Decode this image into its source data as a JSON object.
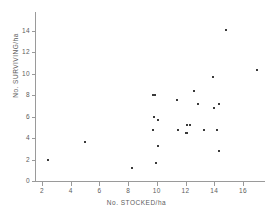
{
  "chart_data": {
    "type": "scatter",
    "title": "",
    "xlabel": "No. STOCKED/ha",
    "ylabel": "No. SURVIVING/ha",
    "xlim": [
      1.2,
      17.8
    ],
    "ylim": [
      0,
      15.0
    ],
    "xticks": [
      2,
      4,
      6,
      8,
      10,
      12,
      14,
      16
    ],
    "yticks": [
      0,
      2,
      4,
      6,
      8,
      10,
      12,
      14
    ],
    "xticklabels": [
      "2",
      "4",
      "6",
      "8",
      "10",
      "12",
      "14",
      "16"
    ],
    "yticklabels": [
      "0",
      "2",
      "4",
      "6",
      "8",
      "10",
      "12",
      "14"
    ],
    "grid": false,
    "legend": null,
    "marker": "square",
    "marker_color": "#3a3a3a",
    "points": [
      {
        "x": 2.4,
        "y": 2.0
      },
      {
        "x": 5.0,
        "y": 3.6
      },
      {
        "x": 8.3,
        "y": 1.2
      },
      {
        "x": 9.7,
        "y": 8.0
      },
      {
        "x": 9.9,
        "y": 8.05
      },
      {
        "x": 9.8,
        "y": 6.0
      },
      {
        "x": 9.7,
        "y": 4.8
      },
      {
        "x": 10.1,
        "y": 5.65
      },
      {
        "x": 10.1,
        "y": 3.25
      },
      {
        "x": 9.95,
        "y": 1.65
      },
      {
        "x": 11.4,
        "y": 7.6
      },
      {
        "x": 11.5,
        "y": 4.8
      },
      {
        "x": 12.0,
        "y": 4.5
      },
      {
        "x": 12.1,
        "y": 4.45
      },
      {
        "x": 12.1,
        "y": 5.2
      },
      {
        "x": 12.3,
        "y": 5.2
      },
      {
        "x": 12.6,
        "y": 8.4
      },
      {
        "x": 12.9,
        "y": 7.2
      },
      {
        "x": 13.3,
        "y": 4.8
      },
      {
        "x": 13.9,
        "y": 9.7
      },
      {
        "x": 14.0,
        "y": 6.85
      },
      {
        "x": 14.2,
        "y": 4.8
      },
      {
        "x": 14.3,
        "y": 7.2
      },
      {
        "x": 14.3,
        "y": 2.8
      },
      {
        "x": 14.8,
        "y": 14.1
      },
      {
        "x": 17.0,
        "y": 10.4
      }
    ]
  }
}
